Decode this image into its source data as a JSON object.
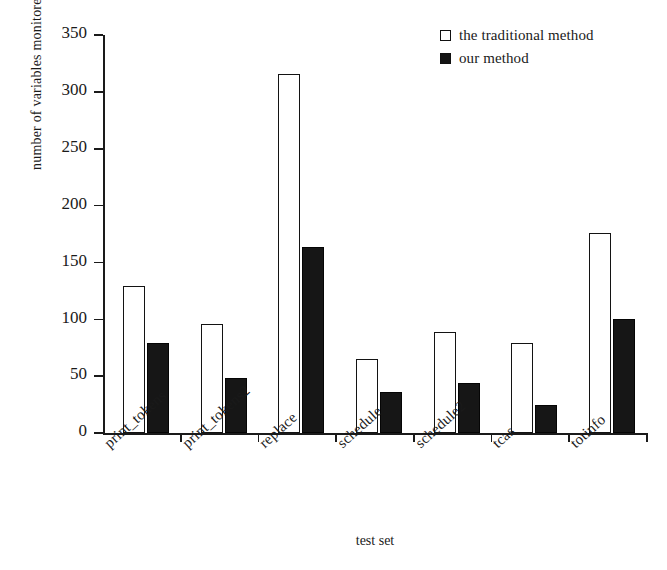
{
  "chart_data": {
    "type": "bar",
    "title": "",
    "xlabel": "test set",
    "ylabel": "number of variables monitored",
    "ylim": [
      0,
      350
    ],
    "ytick_step": 50,
    "yticks": [
      0,
      50,
      100,
      150,
      200,
      250,
      300,
      350
    ],
    "grid": false,
    "legend_position": "top-right",
    "categories": [
      "print_tokens",
      "print_tokens2",
      "replace",
      "schedule",
      "schedule2",
      "tcas",
      "totinfo"
    ],
    "series": [
      {
        "name": "the traditional method",
        "color": "#ffffff",
        "edge_color": "#131313",
        "swatch": "hollow",
        "values": [
          129,
          96,
          316,
          65,
          89,
          79,
          176
        ]
      },
      {
        "name": "our method",
        "color": "#161616",
        "edge_color": "#050505",
        "swatch": "filled",
        "values": [
          79,
          48,
          164,
          36,
          44,
          25,
          100
        ]
      }
    ]
  },
  "legend": {
    "items": [
      {
        "label": "the traditional method",
        "swatch": "hollow-square-icon"
      },
      {
        "label": "our method",
        "swatch": "filled-square-icon"
      }
    ]
  },
  "axes": {
    "y_title": "number of variables monitored",
    "x_title": "test set",
    "y_tick_labels": [
      "350",
      "300",
      "250",
      "200",
      "150",
      "100",
      "50",
      "0"
    ]
  }
}
